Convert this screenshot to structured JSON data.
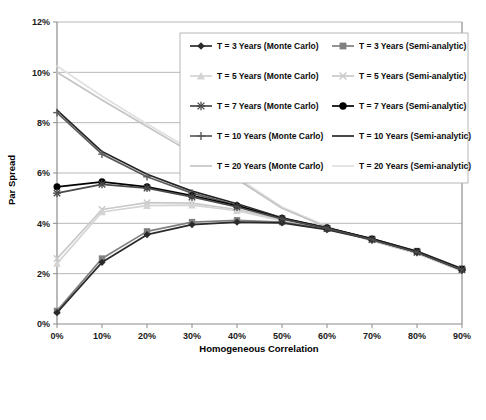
{
  "chart_data": {
    "type": "line",
    "title": "",
    "xlabel": "Homogeneous Correlation",
    "ylabel": "Par Spread",
    "x": [
      0,
      10,
      20,
      30,
      40,
      50,
      60,
      70,
      80,
      90
    ],
    "xtick_labels": [
      "0%",
      "10%",
      "20%",
      "30%",
      "40%",
      "50%",
      "60%",
      "70%",
      "80%",
      "90%"
    ],
    "ytick_labels": [
      "0%",
      "2%",
      "4%",
      "6%",
      "8%",
      "10%",
      "12%"
    ],
    "ytick_values": [
      0,
      2,
      4,
      6,
      8,
      10,
      12
    ],
    "xlim": [
      0,
      90
    ],
    "ylim": [
      0,
      12
    ],
    "grid": true,
    "legend_position": "upper-center-inside",
    "series": [
      {
        "name": "T = 3 Years (Monte Carlo)",
        "marker": "diamond",
        "color": "#2b2b2b",
        "values": [
          0.45,
          2.45,
          3.55,
          3.95,
          4.05,
          4.02,
          3.75,
          3.35,
          2.85,
          2.15
        ]
      },
      {
        "name": "T = 3 Years (Semi-analytic)",
        "marker": "square",
        "color": "#808080",
        "values": [
          0.52,
          2.6,
          3.68,
          4.05,
          4.12,
          4.05,
          3.78,
          3.38,
          2.9,
          2.2
        ]
      },
      {
        "name": "T = 5 Years (Monte Carlo)",
        "marker": "triangle",
        "color": "#d4d4d4",
        "values": [
          2.4,
          4.45,
          4.7,
          4.72,
          4.5,
          4.1,
          3.78,
          3.35,
          2.85,
          2.18
        ]
      },
      {
        "name": "T = 5 Years (Semi-analytic)",
        "marker": "x",
        "color": "#c9c9c9",
        "values": [
          2.6,
          4.55,
          4.82,
          4.8,
          4.55,
          4.15,
          3.8,
          3.38,
          2.88,
          2.2
        ]
      },
      {
        "name": "T = 7 Years (Monte Carlo)",
        "marker": "star",
        "color": "#4a4a4a",
        "values": [
          5.2,
          5.55,
          5.4,
          5.05,
          4.65,
          4.18,
          3.8,
          3.35,
          2.85,
          2.15
        ]
      },
      {
        "name": "T = 7 Years (Semi-analytic)",
        "marker": "circle",
        "color": "#000000",
        "values": [
          5.45,
          5.65,
          5.45,
          5.1,
          4.7,
          4.2,
          3.82,
          3.38,
          2.88,
          2.18
        ]
      },
      {
        "name": "T = 10 Years (Monte Carlo)",
        "marker": "plus",
        "color": "#5c5c5c",
        "values": [
          8.4,
          6.75,
          5.85,
          5.2,
          4.72,
          4.2,
          3.8,
          3.35,
          2.85,
          2.15
        ]
      },
      {
        "name": "T = 10 Years (Semi-analytic)",
        "marker": "none",
        "color": "#262626",
        "values": [
          8.5,
          6.85,
          5.95,
          5.28,
          4.78,
          4.22,
          3.82,
          3.38,
          2.88,
          2.18
        ]
      },
      {
        "name": "T = 20 Years (Monte Carlo)",
        "marker": "none",
        "color": "#c4c4c4",
        "values": [
          10.0,
          8.9,
          7.85,
          6.8,
          5.75,
          4.6,
          3.85,
          3.3,
          2.8,
          2.1
        ]
      },
      {
        "name": "T = 20 Years (Semi-analytic)",
        "marker": "none",
        "color": "#e0e0e0",
        "values": [
          10.25,
          9.05,
          7.95,
          6.9,
          5.82,
          4.65,
          3.88,
          3.32,
          2.82,
          2.12
        ]
      }
    ]
  },
  "axes": {
    "x_title": "Homogeneous Correlation",
    "y_title": "Par Spread"
  },
  "legend": {
    "entries": [
      "T = 3 Years (Monte Carlo)",
      "T = 3 Years (Semi-analytic)",
      "T = 5 Years (Monte Carlo)",
      "T = 5 Years (Semi-analytic)",
      "T = 7 Years (Monte Carlo)",
      "T = 7 Years (Semi-analytic)",
      "T = 10 Years (Monte Carlo)",
      "T = 10 Years (Semi-analytic)",
      "T = 20 Years (Monte Carlo)",
      "T = 20 Years (Semi-analytic)"
    ]
  },
  "ticks": {
    "x": [
      "0%",
      "10%",
      "20%",
      "30%",
      "40%",
      "50%",
      "60%",
      "70%",
      "80%",
      "90%"
    ],
    "y": [
      "0%",
      "2%",
      "4%",
      "6%",
      "8%",
      "10%",
      "12%"
    ]
  }
}
